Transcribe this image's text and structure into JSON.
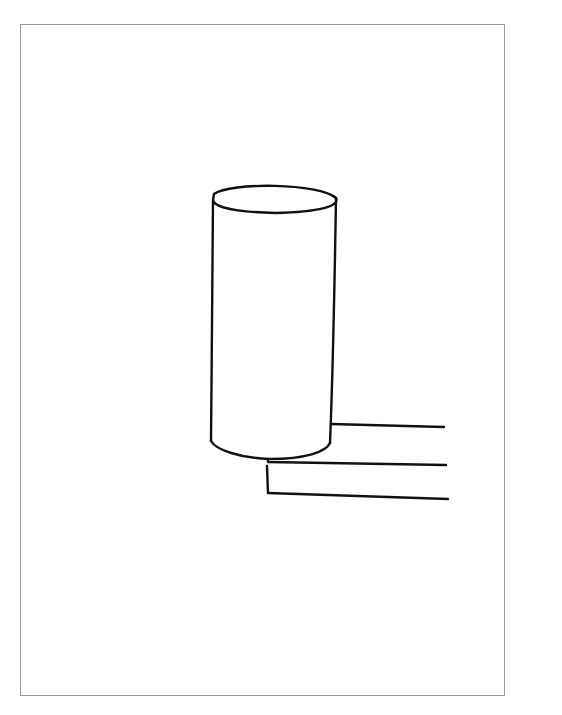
{
  "figure": {
    "elements": [
      "cylinder-top-ellipse",
      "cylinder-left-side",
      "cylinder-right-side",
      "cylinder-bottom-arc",
      "ledge-upper-edge",
      "ledge-middle-edge",
      "ledge-lower-edge",
      "ledge-front-vertical"
    ]
  }
}
